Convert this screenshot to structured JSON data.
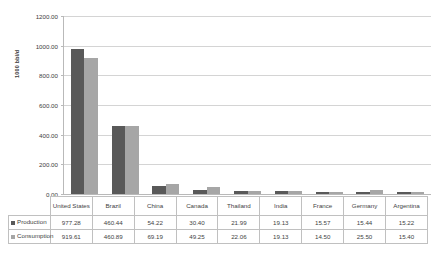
{
  "chart_data": {
    "type": "bar",
    "title": "",
    "xlabel": "",
    "ylabel": "1000 bbl/d",
    "ylim": [
      0,
      1200
    ],
    "ytick_step": 200,
    "ytick_labels": [
      "0.00",
      "200.00",
      "400.00",
      "600.00",
      "800.00",
      "1000.00",
      "1200.00"
    ],
    "grid": true,
    "legend_position": "data-table",
    "categories": [
      "United States",
      "Brazil",
      "China",
      "Canada",
      "Thailand",
      "India",
      "France",
      "Germany",
      "Argentina"
    ],
    "series": [
      {
        "name": "Production",
        "color": "#595959",
        "values": [
          977.28,
          460.44,
          54.22,
          30.4,
          21.99,
          19.13,
          15.57,
          15.44,
          15.22
        ],
        "labels": [
          "977.28",
          "460.44",
          "54.22",
          "30.40",
          "21.99",
          "19.13",
          "15.57",
          "15.44",
          "15.22"
        ]
      },
      {
        "name": "Consumption",
        "color": "#a6a6a6",
        "values": [
          919.61,
          460.89,
          69.19,
          49.25,
          22.06,
          19.13,
          14.5,
          25.5,
          15.4
        ],
        "labels": [
          "919.61",
          "460.89",
          "69.19",
          "49.25",
          "22.06",
          "19.13",
          "14.50",
          "25.50",
          "15.40"
        ]
      }
    ]
  }
}
